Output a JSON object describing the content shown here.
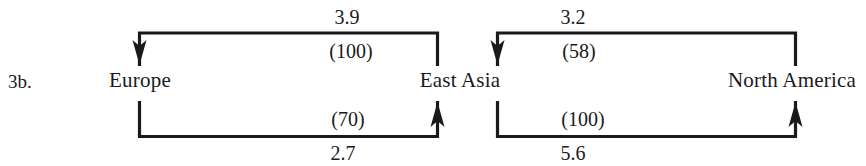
{
  "figure": {
    "number": "3b.",
    "nodes": [
      {
        "id": "europe",
        "label": "Europe"
      },
      {
        "id": "east-asia",
        "label": "East Asia"
      },
      {
        "id": "north-america",
        "label": "North America"
      }
    ],
    "edges": [
      {
        "id": "east-asia-to-europe",
        "from": "East Asia",
        "to": "Europe",
        "direction": "right-to-left",
        "position": "top",
        "group": 1,
        "value": "3.9",
        "index": "(100)"
      },
      {
        "id": "europe-to-east-asia",
        "from": "Europe",
        "to": "East Asia",
        "direction": "left-to-right",
        "position": "bottom",
        "group": 1,
        "value": "2.7",
        "index": "(70)"
      },
      {
        "id": "north-america-to-east-asia",
        "from": "North America",
        "to": "East Asia",
        "direction": "right-to-left",
        "position": "top",
        "group": 2,
        "value": "3.2",
        "index": "(58)"
      },
      {
        "id": "east-asia-to-north-america",
        "from": "East Asia",
        "to": "North America",
        "direction": "left-to-right",
        "position": "bottom",
        "group": 2,
        "value": "5.6",
        "index": "(100)"
      }
    ],
    "colors": {
      "ink": "#1a1a1a",
      "background": "#ffffff"
    }
  }
}
